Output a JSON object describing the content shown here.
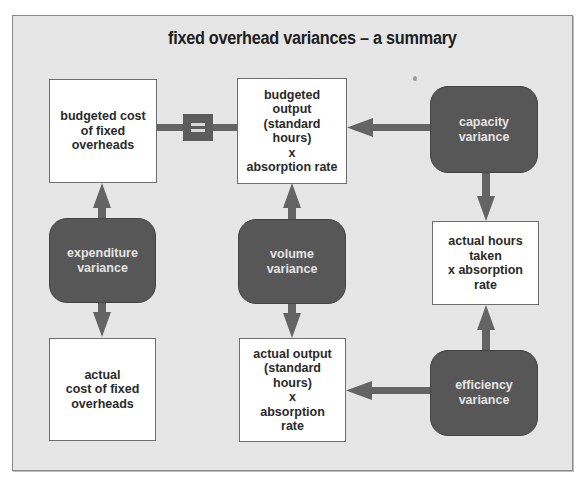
{
  "diagram": {
    "title": "fixed overhead variances – a summary",
    "colors": {
      "panel_background": "#e6e6e6",
      "box_fill": "#ffffff",
      "variance_fill": "#575757",
      "arrow": "#646464",
      "variance_text": "#e4e4e4"
    },
    "nodes": {
      "budgeted_cost": {
        "label": "budgeted cost\nof fixed\noverheads"
      },
      "budgeted_output": {
        "label": "budgeted\noutput\n(standard\nhours)\nx\nabsorption rate"
      },
      "capacity_variance": {
        "label": "capacity\nvariance"
      },
      "expenditure_variance": {
        "label": "expenditure\nvariance"
      },
      "volume_variance": {
        "label": "volume\nvariance"
      },
      "actual_hours": {
        "label": "actual hours\ntaken\nx absorption\nrate"
      },
      "actual_cost": {
        "label": "actual\ncost of fixed\noverheads"
      },
      "actual_output": {
        "label": "actual output\n(standard\nhours)\nx\nabsorption\nrate"
      },
      "efficiency_variance": {
        "label": "efficiency\nvariance"
      }
    },
    "connectors": [
      {
        "from": "budgeted_cost",
        "to": "budgeted_output",
        "type": "equals",
        "symbol": "="
      },
      {
        "from": "expenditure_variance",
        "to": "budgeted_cost",
        "type": "arrow"
      },
      {
        "from": "expenditure_variance",
        "to": "actual_cost",
        "type": "arrow"
      },
      {
        "from": "volume_variance",
        "to": "budgeted_output",
        "type": "arrow"
      },
      {
        "from": "volume_variance",
        "to": "actual_output",
        "type": "arrow"
      },
      {
        "from": "capacity_variance",
        "to": "budgeted_output",
        "type": "arrow"
      },
      {
        "from": "capacity_variance",
        "to": "actual_hours",
        "type": "arrow"
      },
      {
        "from": "efficiency_variance",
        "to": "actual_hours",
        "type": "arrow"
      },
      {
        "from": "efficiency_variance",
        "to": "actual_output",
        "type": "arrow"
      }
    ]
  }
}
